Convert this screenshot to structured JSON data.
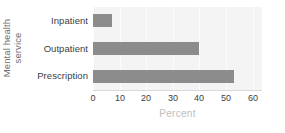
{
  "chart_data": {
    "type": "bar",
    "orientation": "horizontal",
    "title": "",
    "xlabel": "Percent",
    "ylabel": "Mental health service",
    "ylabel_line1": "Mental health",
    "ylabel_line2": "service",
    "categories": [
      "Inpatient",
      "Outpatient",
      "Prescription"
    ],
    "values": [
      7,
      40,
      53
    ],
    "xlim": [
      0,
      63.5
    ],
    "xticks": [
      0,
      10,
      20,
      30,
      40,
      50,
      60
    ],
    "xtick_labels": [
      "0",
      "10",
      "20",
      "30",
      "40",
      "50",
      "60"
    ],
    "grid": true,
    "grid_axis": "x",
    "legend": false,
    "colors": {
      "bar": "#8c8c8c",
      "plot_background": "#f4f4f4",
      "gridline": "#fdfdfd",
      "tick_label": "#3d3d3d",
      "category_label": "#404040",
      "ylabel": "#6e6e6e",
      "xlabel": "#bdbdbd",
      "axis_line": "#d9d9d9",
      "figure_background": "#ffffff"
    }
  }
}
